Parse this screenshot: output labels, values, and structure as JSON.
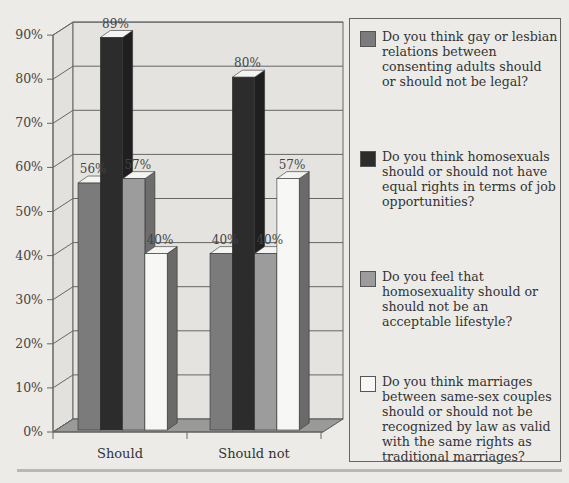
{
  "chart_data": {
    "type": "bar",
    "style": "3d-clustered-column",
    "title": "",
    "xlabel": "",
    "ylabel": "",
    "ylim": [
      0,
      90
    ],
    "yticks": [
      "0%",
      "10%",
      "20%",
      "30%",
      "40%",
      "50%",
      "60%",
      "70%",
      "80%",
      "90%"
    ],
    "categories": [
      "Should",
      "Should not"
    ],
    "grid": true,
    "legend_position": "right",
    "series": [
      {
        "name": "Do you think gay or lesbian relations between consenting adults should or should not be legal?",
        "color": "#7b7b7b",
        "values": [
          56,
          40
        ],
        "labels": [
          "56%",
          "40%"
        ]
      },
      {
        "name": "Do you think homosexuals should or should not have equal rights in terms of job opportunities?",
        "color": "#2c2c2c",
        "values": [
          89,
          80
        ],
        "labels": [
          "89%",
          "80%"
        ]
      },
      {
        "name": "Do you feel that homosexuality should or should not be an acceptable lifestyle?",
        "color": "#9c9c9c",
        "values": [
          57,
          40
        ],
        "labels": [
          "57%",
          "40%"
        ]
      },
      {
        "name": "Do you think marriages between same-sex couples should or should not be recognized by law as valid with the same rights as traditional marriages?",
        "color": "#f7f7f5",
        "values": [
          40,
          57
        ],
        "labels": [
          "40%",
          "57%"
        ]
      }
    ]
  },
  "legend": {
    "items": [
      {
        "text": "Do you think gay or lesbian relations between consenting adults should or should not be legal?",
        "color": "#7b7b7b"
      },
      {
        "text": "Do you think homosexuals should or should not have equal rights in terms of job opportunities?",
        "color": "#2c2c2c"
      },
      {
        "text": "Do you feel that homosexuality should or should not be an acceptable lifestyle?",
        "color": "#9c9c9c"
      },
      {
        "text": "Do you think marriages between same-sex couples should or should not be recognized by law as valid with the same rights as traditional marriages?",
        "color": "#f7f7f5"
      }
    ]
  }
}
